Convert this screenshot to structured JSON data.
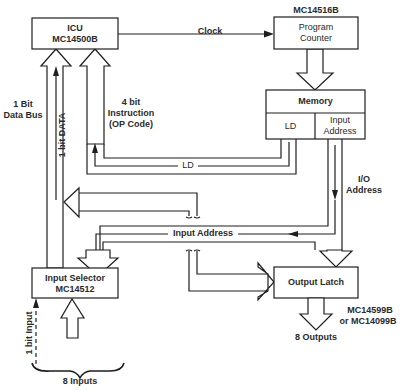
{
  "diagram": {
    "blocks": {
      "icu": {
        "title": "ICU",
        "part": "MC14500B"
      },
      "program_counter": {
        "part_above": "MC14516B",
        "line1": "Program",
        "line2": "Counter"
      },
      "memory": {
        "title": "Memory",
        "left_cell": "LD",
        "right_cell_line1": "Input",
        "right_cell_line2": "Address"
      },
      "input_selector": {
        "title": "Input Selector",
        "part": "MC14512"
      },
      "output_latch": {
        "title": "Output Latch",
        "part_line1": "MC14599B",
        "part_line2": "or MC14099B"
      }
    },
    "labels": {
      "clock": "Clock",
      "data_bus_line1": "1 Bit",
      "data_bus_line2": "Data Bus",
      "instruction_line1": "4 bit",
      "instruction_line2": "Instruction",
      "instruction_line3": "(OP Code)",
      "one_bit_data": "1 bit DATA",
      "ld": "LD",
      "io_line1": "I/O",
      "io_line2": "Address",
      "input_address": "Input Address",
      "one_bit_input": "1 bit Input",
      "eight_inputs": "8 Inputs",
      "eight_outputs": "8 Outputs"
    },
    "colors": {
      "line": "#1e1e1e",
      "text": "#2a2a2a",
      "background": "#ffffff"
    }
  }
}
